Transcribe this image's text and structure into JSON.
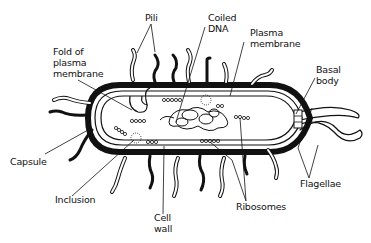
{
  "diagram": {
    "title": "",
    "colors": {
      "ink": "#111111",
      "background": "#ffffff"
    },
    "labels": {
      "pili": "Pili",
      "fold_of_plasma_membrane": "Fold of\nplasma\nmembrane",
      "coiled_dna": "Coiled\nDNA",
      "plasma_membrane": "Plasma\nmembrane",
      "basal_body": "Basal\nbody",
      "capsule": "Capsule",
      "inclusion": "Inclusion",
      "cell_wall": "Cell\nwall",
      "ribosomes": "Ribosomes",
      "flagellae": "Flagellae"
    }
  }
}
